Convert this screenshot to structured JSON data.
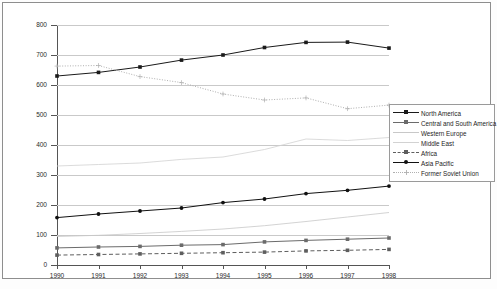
{
  "chart_data": {
    "type": "line",
    "title": "",
    "xlabel": "",
    "ylabel": "Billion cubic metres",
    "categories": [
      "1990",
      "1991",
      "1992",
      "1993",
      "1994",
      "1995",
      "1996",
      "1997",
      "1998"
    ],
    "xlim": [
      1990,
      1998
    ],
    "ylim": [
      0,
      800
    ],
    "yticks": [
      0,
      100,
      200,
      300,
      400,
      500,
      600,
      700,
      800
    ],
    "grid": true,
    "legend_position": "right",
    "series": [
      {
        "name": "North America",
        "color": "#1a1a1a",
        "style": "solid",
        "marker": "square",
        "values": [
          630,
          642,
          660,
          683,
          700,
          725,
          742,
          743,
          723
        ]
      },
      {
        "name": "Central and South America",
        "color": "#6b6b6b",
        "style": "solid",
        "marker": "square",
        "values": [
          57,
          60,
          62,
          66,
          68,
          77,
          82,
          86,
          90
        ]
      },
      {
        "name": "Western Europe",
        "color": "#c8c8c8",
        "style": "solid",
        "marker": "none",
        "values": [
          95,
          99,
          105,
          112,
          120,
          131,
          145,
          160,
          175
        ]
      },
      {
        "name": "Middle East",
        "color": "#d2d2d2",
        "style": "solid",
        "marker": "none",
        "values": [
          330,
          335,
          340,
          352,
          360,
          385,
          420,
          415,
          425
        ]
      },
      {
        "name": "Africa",
        "color": "#5e5e5e",
        "style": "dashed",
        "marker": "square",
        "values": [
          33,
          35,
          37,
          39,
          41,
          43,
          47,
          49,
          52
        ]
      },
      {
        "name": "Asia Pacific",
        "color": "#111111",
        "style": "solid",
        "marker": "circle",
        "values": [
          158,
          170,
          180,
          190,
          208,
          220,
          238,
          249,
          263
        ]
      },
      {
        "name": "Former Soviet Union",
        "color": "#b0b0b0",
        "style": "dotted",
        "marker": "plus",
        "values": [
          663,
          665,
          628,
          608,
          570,
          550,
          557,
          521,
          533
        ]
      }
    ]
  }
}
